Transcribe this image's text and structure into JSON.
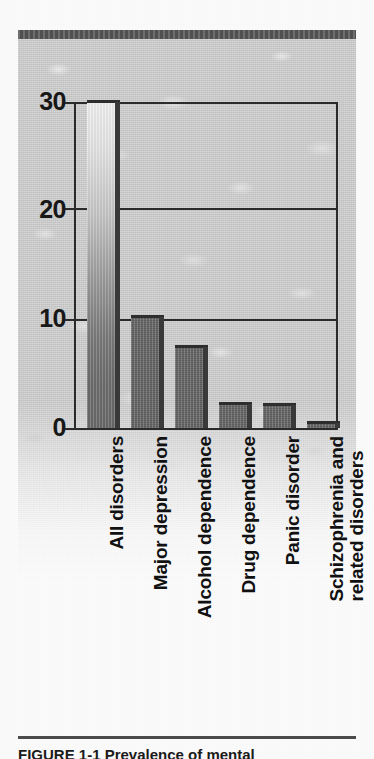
{
  "figure": {
    "caption": "FIGURE 1-1  Prevalence of mental",
    "plate_background_color": "#cfcfcf",
    "bar_color": "#6d6d6d",
    "axis_color": "#2b2b2b"
  },
  "chart_data": {
    "type": "bar",
    "title": "",
    "xlabel": "",
    "ylabel": "",
    "ylim": [
      0,
      30
    ],
    "yticks": [
      0,
      10,
      20,
      30
    ],
    "ytick_labels": [
      "0",
      "10",
      "20",
      "30"
    ],
    "grid": true,
    "grid_axis": "y",
    "legend": false,
    "categories": [
      "All disorders",
      "Major depression",
      "Alcohol dependence",
      "Drug dependence",
      "Panic disorder",
      "Schizophrenia and related disorders"
    ],
    "category_lines": [
      [
        "All disorders"
      ],
      [
        "Major depression"
      ],
      [
        "Alcohol dependence"
      ],
      [
        "Drug dependence"
      ],
      [
        "Panic disorder"
      ],
      [
        "Schizophrenia and",
        "related disorders"
      ]
    ],
    "values": [
      30.0,
      10.2,
      7.5,
      2.2,
      2.1,
      0.5
    ]
  }
}
